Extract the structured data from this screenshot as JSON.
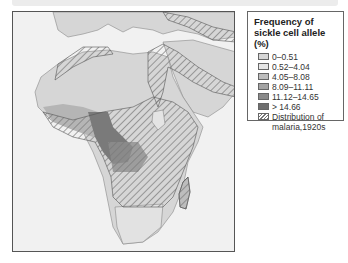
{
  "legend": {
    "title": "Frequency of sickle cell allele (%)",
    "items": [
      {
        "label": "0–0.51",
        "color": "#d6d6d6"
      },
      {
        "label": "0.52–4.04",
        "color": "#e6e6e6"
      },
      {
        "label": "4.05–8.08",
        "color": "#bdbdbd"
      },
      {
        "label": "8.09–11.11",
        "color": "#a3a3a3"
      },
      {
        "label": "11.12–14.65",
        "color": "#8a8a8a"
      },
      {
        "label": "> 14.66",
        "color": "#6f6f6f"
      }
    ],
    "hatch_label": "Distribution of malaria,1920s"
  },
  "map": {
    "region": "Africa, Southern Europe, Middle East",
    "colors": {
      "ocean": "#f1f1f1",
      "land_base": "#d6d6d6",
      "hatch_line": "#7a7a7a",
      "border": "#555555"
    }
  }
}
